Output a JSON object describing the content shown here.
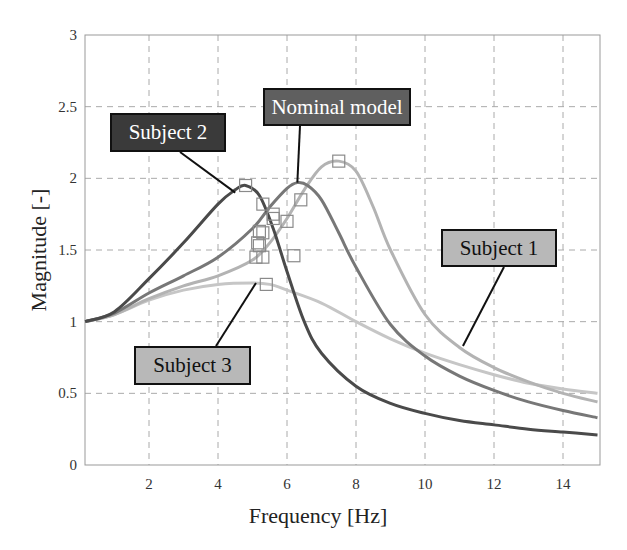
{
  "chart_data": {
    "type": "line",
    "title": "",
    "xlabel": "Frequency [Hz]",
    "ylabel": "Magnitude [-]",
    "xlim": [
      0.15,
      15
    ],
    "ylim": [
      0,
      3
    ],
    "x_ticks": [
      2,
      4,
      6,
      8,
      10,
      12,
      14
    ],
    "y_ticks": [
      0,
      0.5,
      1,
      1.5,
      2,
      2.5,
      3
    ],
    "y_tick_labels": [
      "0",
      "0.5",
      "1",
      "1.5",
      "2",
      "2.5",
      "3"
    ],
    "grid": true,
    "legend": "annotation callouts",
    "series": [
      {
        "name": "Subject 2",
        "color": "#4a4a4a",
        "x": [
          0.15,
          1,
          2,
          3,
          4,
          4.5,
          4.8,
          5.2,
          5.6,
          6,
          6.5,
          7,
          8,
          9,
          10,
          11,
          12,
          13,
          14,
          15
        ],
        "y": [
          1.0,
          1.07,
          1.3,
          1.55,
          1.82,
          1.92,
          1.95,
          1.88,
          1.65,
          1.35,
          1.0,
          0.78,
          0.55,
          0.43,
          0.36,
          0.31,
          0.28,
          0.25,
          0.23,
          0.21
        ]
      },
      {
        "name": "Nominal model",
        "color": "#777777",
        "x": [
          0.15,
          1,
          2,
          3,
          4,
          5,
          5.5,
          6,
          6.3,
          6.6,
          7,
          7.5,
          8,
          9,
          10,
          11,
          12,
          13,
          14,
          15
        ],
        "y": [
          1.0,
          1.06,
          1.2,
          1.32,
          1.45,
          1.65,
          1.8,
          1.93,
          1.97,
          1.95,
          1.85,
          1.62,
          1.38,
          0.98,
          0.76,
          0.62,
          0.52,
          0.44,
          0.38,
          0.33
        ]
      },
      {
        "name": "Subject 1",
        "color": "#b3b3b3",
        "x": [
          0.15,
          1,
          2,
          3,
          4,
          5,
          5.5,
          6,
          6.5,
          7,
          7.5,
          8,
          8.5,
          9,
          10,
          11,
          12,
          13,
          14,
          15
        ],
        "y": [
          1.0,
          1.05,
          1.16,
          1.25,
          1.32,
          1.43,
          1.55,
          1.72,
          1.92,
          2.08,
          2.12,
          2.05,
          1.8,
          1.5,
          1.05,
          0.82,
          0.68,
          0.58,
          0.5,
          0.44
        ]
      },
      {
        "name": "Subject 3",
        "color": "#c6c6c6",
        "x": [
          0.15,
          1,
          2,
          3,
          4,
          5,
          5.5,
          6,
          7,
          8,
          9,
          10,
          11,
          12,
          13,
          14,
          15
        ],
        "y": [
          1.0,
          1.05,
          1.15,
          1.22,
          1.26,
          1.27,
          1.26,
          1.22,
          1.13,
          1.0,
          0.88,
          0.78,
          0.7,
          0.63,
          0.57,
          0.53,
          0.5
        ]
      }
    ],
    "markers": {
      "shape": "square",
      "points": [
        {
          "x": 4.8,
          "y": 1.95
        },
        {
          "x": 7.5,
          "y": 2.12
        },
        {
          "x": 5.4,
          "y": 1.26
        },
        {
          "x": 5.3,
          "y": 1.82
        },
        {
          "x": 6.4,
          "y": 1.85
        },
        {
          "x": 5.6,
          "y": 1.75
        },
        {
          "x": 5.6,
          "y": 1.72
        },
        {
          "x": 6.0,
          "y": 1.7
        },
        {
          "x": 5.2,
          "y": 1.63
        },
        {
          "x": 5.3,
          "y": 1.62
        },
        {
          "x": 5.15,
          "y": 1.55
        },
        {
          "x": 5.2,
          "y": 1.53
        },
        {
          "x": 5.1,
          "y": 1.45
        },
        {
          "x": 5.3,
          "y": 1.45
        },
        {
          "x": 6.2,
          "y": 1.46
        }
      ]
    },
    "annotations": [
      {
        "text": "Subject 2",
        "box_color": "#3a3a3a",
        "text_color": "#ffffff",
        "points_to": {
          "x": 4.5,
          "y": 1.9
        }
      },
      {
        "text": "Nominal model",
        "box_color": "#5f5f5f",
        "text_color": "#ffffff",
        "points_to": {
          "x": 6.3,
          "y": 1.97
        }
      },
      {
        "text": "Subject 1",
        "box_color": "#b8b8b8",
        "text_color": "#111111",
        "points_to": {
          "x": 11.1,
          "y": 0.83
        }
      },
      {
        "text": "Subject 3",
        "box_color": "#b8b8b8",
        "text_color": "#111111",
        "points_to": {
          "x": 5.1,
          "y": 1.27
        }
      }
    ]
  }
}
